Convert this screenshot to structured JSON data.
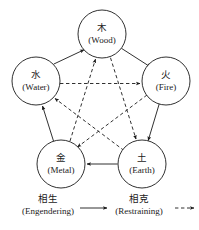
{
  "diagram": {
    "background_color": "#ffffff",
    "line_color": "#1a1a1a",
    "nodes": [
      {
        "id": "wood",
        "cn": "木",
        "en": "(Wood)",
        "cx": 102,
        "cy": 34,
        "r": 24
      },
      {
        "id": "fire",
        "cn": "火",
        "en": "(Fire)",
        "cx": 166,
        "cy": 81,
        "r": 24
      },
      {
        "id": "earth",
        "cn": "土",
        "en": "(Earth)",
        "cx": 142,
        "cy": 164,
        "r": 24
      },
      {
        "id": "metal",
        "cn": "金",
        "en": "(Metal)",
        "cx": 61,
        "cy": 164,
        "r": 24
      },
      {
        "id": "water",
        "cn": "水",
        "en": "(Water)",
        "cx": 36,
        "cy": 81,
        "r": 24
      }
    ],
    "engendering_edges": [
      {
        "from": "water",
        "to": "wood"
      },
      {
        "from": "wood",
        "to": "fire"
      },
      {
        "from": "fire",
        "to": "earth"
      },
      {
        "from": "earth",
        "to": "metal"
      },
      {
        "from": "metal",
        "to": "water"
      }
    ],
    "restraining_edges": [
      {
        "from": "water",
        "to": "fire"
      },
      {
        "from": "fire",
        "to": "metal"
      },
      {
        "from": "metal",
        "to": "wood"
      },
      {
        "from": "wood",
        "to": "earth"
      },
      {
        "from": "earth",
        "to": "water"
      }
    ]
  },
  "legend": {
    "engendering": {
      "cn": "相生",
      "en": "(Engendering)",
      "arrow_style": "solid"
    },
    "restraining": {
      "cn": "相克",
      "en": "(Restraining)",
      "arrow_style": "dashed"
    }
  }
}
